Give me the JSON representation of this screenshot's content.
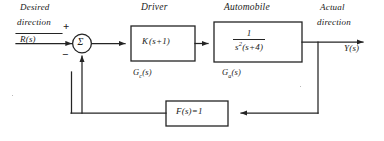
{
  "diagram": {
    "ink_color": "#242424",
    "background": "#ffffff"
  },
  "input": {
    "label_line1": "Desired",
    "label_line2": "direction",
    "signal": "R(s)"
  },
  "summing_junction": {
    "symbol": "Σ",
    "name": "summing-junction",
    "plus_sign": "+",
    "minus_sign": "−"
  },
  "blocks": [
    {
      "id": "driver",
      "title": "Driver",
      "expression": "K(s+1)",
      "expression_parts": {
        "gain": "K",
        "factor": "(s+1)"
      },
      "sublabel_base": "G",
      "sublabel_sub": "c",
      "sublabel_suffix": "(s)",
      "sublabel": "Gc(s)"
    },
    {
      "id": "automobile",
      "title": "Automobile",
      "expression": "1 / (s^2 (s+4))",
      "numerator": "1",
      "denominator_base": "s",
      "denominator_exp": "2",
      "denominator_rest": "(s+4)",
      "sublabel_base": "G",
      "sublabel_sub": "a",
      "sublabel_suffix": "(s)",
      "sublabel": "Ga(s)"
    }
  ],
  "feedback": {
    "id": "feedback",
    "expression": "F(s) = 1",
    "expression_lhs": "F(s)",
    "expression_eq": "=",
    "expression_rhs": "1"
  },
  "output": {
    "label_line1": "Actual",
    "label_line2": "direction",
    "signal": "Y(s)"
  }
}
